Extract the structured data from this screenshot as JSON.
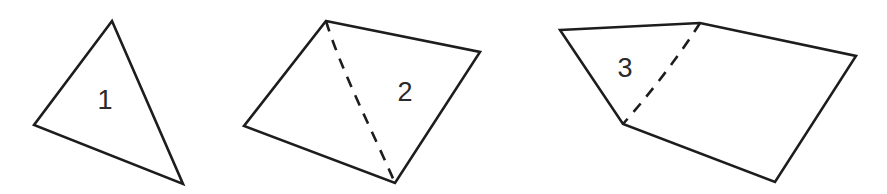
{
  "figure": {
    "background_color": "#ffffff",
    "stroke_color": "#1d1d1d",
    "label_color": "#2a2a2a",
    "width": 887,
    "height": 194
  },
  "shapes": [
    {
      "label": "1",
      "kind": "triangle",
      "label_position": {
        "x": 105,
        "y": 100
      },
      "outline_points": "112,21 183,184 34,125",
      "diagonal": null
    },
    {
      "label": "2",
      "kind": "quadrilateral",
      "label_position": {
        "x": 405,
        "y": 92
      },
      "outline_points": "326,21 480,52 395,183 244,126",
      "diagonal": "M326,21 C341,70 372,130 395,183"
    },
    {
      "label": "3",
      "kind": "quadrilateral",
      "label_position": {
        "x": 625,
        "y": 68
      },
      "outline_points": "560,30 700,23 856,56 775,182 623,124",
      "diagonal": "M700,23 C678,58 647,97 623,124"
    }
  ]
}
